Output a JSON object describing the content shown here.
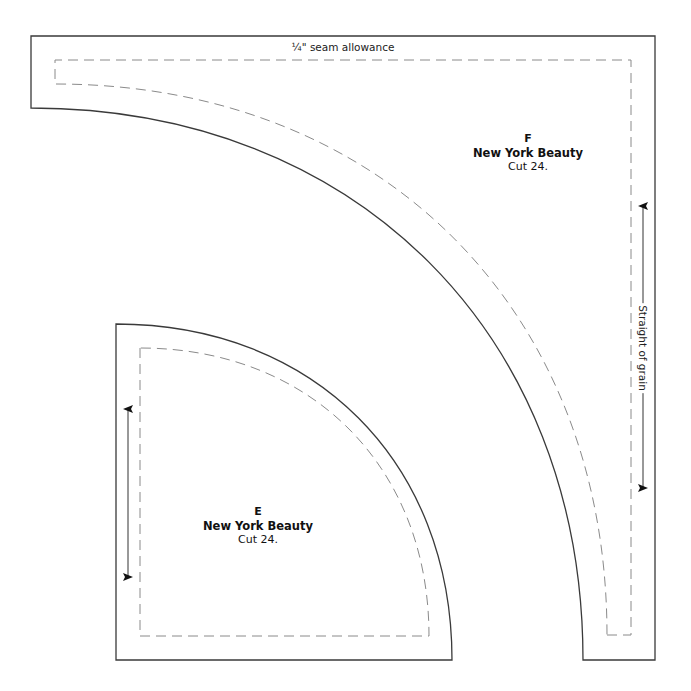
{
  "diagram": {
    "type": "quilt-template",
    "colors": {
      "outline": "#3a3a3a",
      "seam_line": "#8a8a8a",
      "text": "#111111"
    },
    "seam_allowance_label": "¼\" seam allowance",
    "grain_label": "Straight of grain",
    "pieces": [
      {
        "id": "F",
        "letter": "F",
        "name": "New York Beauty",
        "cut": "Cut 24."
      },
      {
        "id": "E",
        "letter": "E",
        "name": "New York Beauty",
        "cut": "Cut 24."
      }
    ]
  }
}
